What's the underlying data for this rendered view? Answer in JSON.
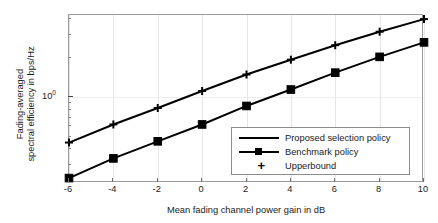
{
  "chart_data": {
    "type": "line",
    "title": "",
    "xlabel": "Mean fading channel power gain in dB",
    "ylabel": "Fading-averaged spectral efficiency in bps/Hz",
    "ylabel_line1": "Fading-averaged",
    "ylabel_line2": "spectral efficiency in bps/Hz",
    "x": [
      -6,
      -4,
      -2,
      0,
      2,
      4,
      6,
      8,
      10
    ],
    "xticklabels": [
      "-6",
      "-4",
      "-2",
      "0",
      "2",
      "4",
      "6",
      "8",
      "10"
    ],
    "xlim": [
      -6,
      10
    ],
    "yscale": "log",
    "ylim": [
      0.22,
      4.3
    ],
    "ytick_major": 1,
    "ytick_major_label": "10",
    "ytick_major_exponent": "0",
    "ytick_minor": [
      0.3,
      0.4,
      0.5,
      0.6,
      0.7,
      0.8,
      0.9,
      2,
      3,
      4
    ],
    "grid": true,
    "legend_position": "lower right",
    "series": [
      {
        "name": "Proposed selection policy",
        "marker": "none",
        "values": [
          0.45,
          0.62,
          0.83,
          1.12,
          1.5,
          1.95,
          2.52,
          3.2,
          4.0
        ]
      },
      {
        "name": "Benchmark policy",
        "marker": "square",
        "values": [
          0.24,
          0.34,
          0.46,
          0.62,
          0.86,
          1.15,
          1.55,
          2.05,
          2.65
        ]
      },
      {
        "name": "Upperbound",
        "marker": "plus",
        "values": [
          0.45,
          0.62,
          0.83,
          1.12,
          1.5,
          1.95,
          2.52,
          3.2,
          4.0
        ]
      }
    ]
  },
  "legend": {
    "items": [
      {
        "label": "Proposed selection policy",
        "symbol": "line"
      },
      {
        "label": "Benchmark policy",
        "symbol": "line-square"
      },
      {
        "label": "Upperbound",
        "symbol": "plus"
      }
    ]
  }
}
